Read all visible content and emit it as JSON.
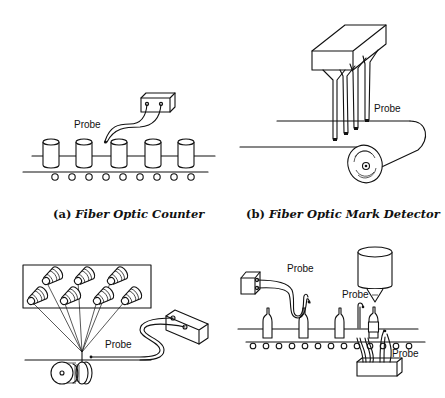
{
  "figures": [
    {
      "id": "a",
      "caption_prefix": "(a)",
      "caption": "Fiber Optic Counter",
      "probe_labels": [
        "Probe"
      ]
    },
    {
      "id": "b",
      "caption_prefix": "(b)",
      "caption": "Fiber Optic Mark Detector",
      "probe_labels": [
        "Probe"
      ]
    },
    {
      "id": "c",
      "probe_labels": [
        "Probe"
      ]
    },
    {
      "id": "d",
      "probe_labels": [
        "Probe",
        "Probe",
        "Probe"
      ]
    }
  ],
  "colors": {
    "ink": "#111111",
    "paper": "#ffffff"
  }
}
